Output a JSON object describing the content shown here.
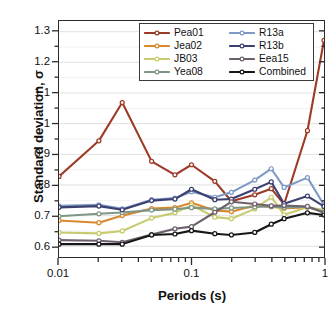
{
  "chart_data": {
    "type": "line",
    "title": "",
    "xlabel": "Periods (s)",
    "ylabel": "Standard deviation, σ",
    "xscale": "log",
    "xlim": [
      0.01,
      1.0
    ],
    "ylim": [
      0.565,
      1.335
    ],
    "yticks": [
      0.6,
      0.7,
      0.8,
      0.9,
      1.0,
      1.1,
      1.2,
      1.3
    ],
    "ytick_labels": [
      "0.6",
      "0.7",
      "0.8",
      "0.9",
      "1",
      "1.1",
      "1.2",
      "1.3"
    ],
    "xticks": [
      0.01,
      0.1,
      1
    ],
    "xtick_labels": [
      "0.01",
      "0.1",
      "1"
    ],
    "grid": "horizontal-minor",
    "legend_position": "top-center",
    "marker": "open-circle",
    "x": [
      0.01,
      0.02,
      0.03,
      0.05,
      0.075,
      0.1,
      0.15,
      0.2,
      0.3,
      0.4,
      0.5,
      0.75,
      1.0
    ],
    "series": [
      {
        "name": "Pea01",
        "color": "#9c3a26",
        "values": [
          0.828,
          0.944,
          1.069,
          0.877,
          0.833,
          0.866,
          0.812,
          0.747,
          0.768,
          0.788,
          0.737,
          0.977,
          1.272
        ]
      },
      {
        "name": "Jea02",
        "color": "#d9882c",
        "values": [
          0.684,
          0.677,
          0.7,
          0.723,
          0.726,
          0.742,
          0.717,
          0.713,
          0.733,
          0.729,
          0.724,
          0.727,
          0.715
        ]
      },
      {
        "name": "JB03",
        "color": "#c7cb6d",
        "values": [
          0.645,
          0.642,
          0.65,
          0.692,
          0.709,
          0.734,
          0.695,
          0.69,
          0.722,
          0.76,
          0.703,
          0.727,
          0.718
        ]
      },
      {
        "name": "Yea08",
        "color": "#7f9686",
        "values": [
          0.698,
          0.706,
          0.71,
          0.718,
          0.721,
          0.726,
          0.722,
          0.725,
          0.728,
          0.73,
          0.727,
          0.729,
          0.712
        ]
      },
      {
        "name": "R13a",
        "color": "#7d99c6",
        "values": [
          0.732,
          0.735,
          0.722,
          0.752,
          0.757,
          0.778,
          0.76,
          0.776,
          0.816,
          0.853,
          0.792,
          0.824,
          0.735
        ]
      },
      {
        "name": "R13b",
        "color": "#3c4070",
        "values": [
          0.727,
          0.731,
          0.719,
          0.749,
          0.754,
          0.786,
          0.752,
          0.754,
          0.786,
          0.81,
          0.739,
          0.764,
          0.73
        ]
      },
      {
        "name": "Eea15",
        "color": "#6d606d",
        "values": [
          0.62,
          0.618,
          0.613,
          0.638,
          0.657,
          0.664,
          0.711,
          0.745,
          0.738,
          0.732,
          0.733,
          0.73,
          0.709
        ]
      },
      {
        "name": "Combined",
        "color": "#161616",
        "values": [
          0.607,
          0.607,
          0.607,
          0.637,
          0.64,
          0.651,
          0.641,
          0.637,
          0.645,
          0.672,
          0.69,
          0.709,
          0.702
        ]
      }
    ]
  },
  "legend": {
    "column_left": [
      "Pea01",
      "Jea02",
      "JB03",
      "Yea08"
    ],
    "column_right": [
      "R13a",
      "R13b",
      "Eea15",
      "Combined"
    ]
  }
}
